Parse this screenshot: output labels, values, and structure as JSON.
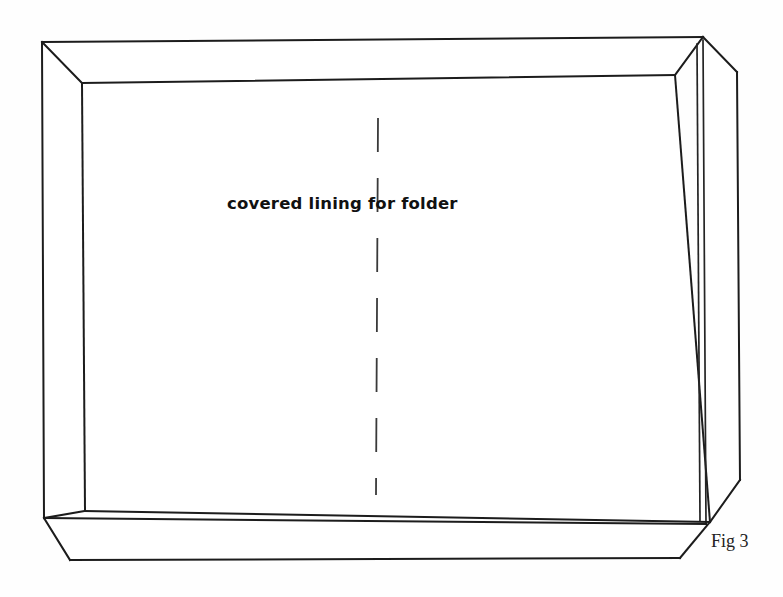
{
  "figure": {
    "caption": "Fig 3",
    "label": "covered lining for folder",
    "title": "covered lining for folder",
    "line_color": "#1c1c1c",
    "background_color": "#fefefe",
    "fold_line_color": "#3a3a3a"
  },
  "geometry": {
    "outer_top_left": "42,42",
    "outer_top_right": "703,37",
    "outer_bottom_left": "44,518",
    "inner_top_left": "82,83",
    "inner_top_right": "675,75",
    "inner_bottom_left": "85,511",
    "inner_bottom_right": "710,522",
    "side_panel_outer_top": "737,72",
    "flap_left": "70,560",
    "flap_right": "680,558",
    "fold_x": 377,
    "fold_top_y": 118,
    "fold_bottom_y": 495
  }
}
